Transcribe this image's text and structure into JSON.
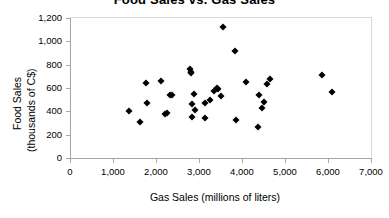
{
  "chart_data": {
    "type": "scatter",
    "title": "Food Sales vs. Gas Sales",
    "xlabel": "Gas Sales (millions of liters)",
    "ylabel_line1": "Food Sales",
    "ylabel_line2": "(thousands of C$)",
    "xlim": [
      0,
      7000
    ],
    "ylim": [
      0,
      1200
    ],
    "xticks": [
      0,
      1000,
      2000,
      3000,
      4000,
      5000,
      6000,
      7000
    ],
    "xtick_labels": [
      "0",
      "1,000",
      "2,000",
      "3,000",
      "4,000",
      "5,000",
      "6,000",
      "7,000"
    ],
    "yticks": [
      0,
      200,
      400,
      600,
      800,
      1000,
      1200
    ],
    "ytick_labels": [
      "0",
      "200",
      "400",
      "600",
      "800",
      "1,000",
      "1,200"
    ],
    "grid": false,
    "legend": null,
    "marker": "diamond",
    "marker_color": "#000000",
    "points": [
      {
        "x": 1370,
        "y": 405
      },
      {
        "x": 1620,
        "y": 310
      },
      {
        "x": 1760,
        "y": 640
      },
      {
        "x": 1780,
        "y": 475
      },
      {
        "x": 2110,
        "y": 660
      },
      {
        "x": 2210,
        "y": 378
      },
      {
        "x": 2260,
        "y": 385
      },
      {
        "x": 2330,
        "y": 540
      },
      {
        "x": 2380,
        "y": 540
      },
      {
        "x": 2800,
        "y": 760
      },
      {
        "x": 2810,
        "y": 740
      },
      {
        "x": 2820,
        "y": 725
      },
      {
        "x": 2830,
        "y": 355
      },
      {
        "x": 2840,
        "y": 460
      },
      {
        "x": 2880,
        "y": 550
      },
      {
        "x": 2900,
        "y": 410
      },
      {
        "x": 3130,
        "y": 470
      },
      {
        "x": 3150,
        "y": 345
      },
      {
        "x": 3250,
        "y": 500
      },
      {
        "x": 3360,
        "y": 575
      },
      {
        "x": 3420,
        "y": 600
      },
      {
        "x": 3450,
        "y": 595
      },
      {
        "x": 3520,
        "y": 530
      },
      {
        "x": 3560,
        "y": 1120
      },
      {
        "x": 3840,
        "y": 920
      },
      {
        "x": 3870,
        "y": 325
      },
      {
        "x": 4090,
        "y": 648
      },
      {
        "x": 4370,
        "y": 265
      },
      {
        "x": 4390,
        "y": 540
      },
      {
        "x": 4460,
        "y": 428
      },
      {
        "x": 4510,
        "y": 478
      },
      {
        "x": 4570,
        "y": 635
      },
      {
        "x": 4640,
        "y": 680
      },
      {
        "x": 5850,
        "y": 715
      },
      {
        "x": 6100,
        "y": 568
      }
    ]
  }
}
